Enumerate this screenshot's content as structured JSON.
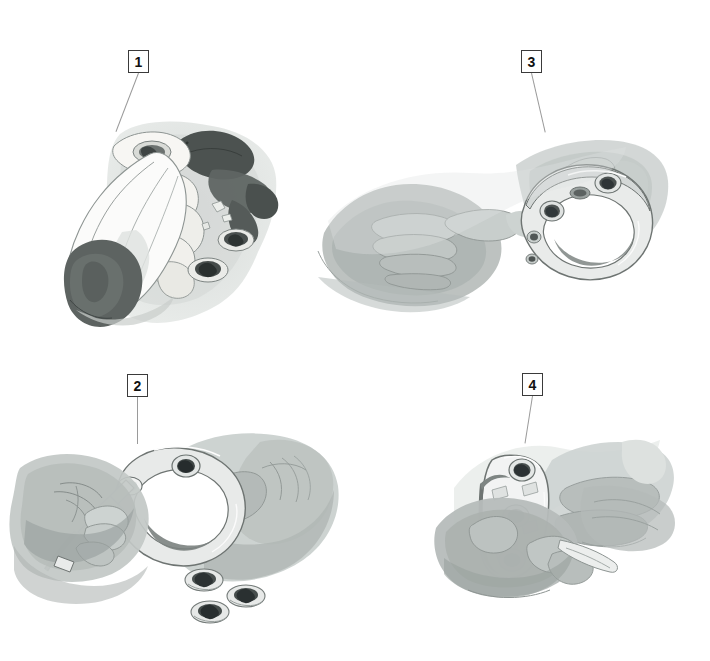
{
  "figure": {
    "kind": "instructional-illustration",
    "style": "grayscale watercolor medical illustration",
    "background_color": "#ffffff",
    "panel_count": 4,
    "callout_box": {
      "border_color": "#3a3a3a",
      "fill_color": "#ffffff",
      "text_color": "#111111",
      "leader_color": "#9a9a9a"
    },
    "palette": {
      "wash_light": "#e3e6e4",
      "wash_mid": "#c8cccb",
      "wash_dark": "#a7adab",
      "shadow": "#8e9492",
      "glove_dark": "#5d6361",
      "metal_light": "#f2f3f3",
      "metal_mid": "#b9bfbd",
      "metal_dark": "#6e7472",
      "screw_dark": "#44494a",
      "bone_light": "#f6f5f2",
      "outline": "#6b7270"
    }
  },
  "panels": [
    {
      "number": "1",
      "label": "1",
      "marker_x": 128,
      "marker_y": 50,
      "leader_from": {
        "x": 138,
        "y": 73
      },
      "leader_to": {
        "x": 113,
        "y": 131
      },
      "content": "Gloved hands holding a vertebral body with an instrument; loose components resting nearby",
      "elements": [
        "gloved-hand",
        "bone-segment",
        "driver-instrument",
        "dark-cuff",
        "loose-screws"
      ]
    },
    {
      "number": "3",
      "label": "3",
      "marker_x": 521,
      "marker_y": 50,
      "leader_from": {
        "x": 531,
        "y": 73
      },
      "leader_to": {
        "x": 545,
        "y": 132
      },
      "content": "Two hands holding a curved ring implant populated with locking screws",
      "elements": [
        "left-hand",
        "right-hand",
        "ring-implant",
        "locking-screws"
      ]
    },
    {
      "number": "2",
      "label": "2",
      "marker_x": 127,
      "marker_y": 374,
      "leader_from": {
        "x": 137,
        "y": 397
      },
      "leader_to": {
        "x": 137,
        "y": 443
      },
      "content": "One hand drives a screw into the ring implant held by the other hand; three loose screws below",
      "elements": [
        "driver-instrument",
        "ring-implant",
        "inserted-screw",
        "loose-screw-1",
        "loose-screw-2",
        "loose-screw-3"
      ]
    },
    {
      "number": "4",
      "label": "4",
      "marker_x": 522,
      "marker_y": 373,
      "leader_from": {
        "x": 532,
        "y": 396
      },
      "leader_to": {
        "x": 524,
        "y": 443
      },
      "content": "Hand presenting the finished plate with three seated screws",
      "elements": [
        "plate-implant",
        "screw-top",
        "screw-middle",
        "screw-bottom",
        "supporting-hand"
      ]
    }
  ]
}
